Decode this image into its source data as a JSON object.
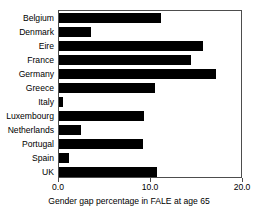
{
  "chart_data": {
    "type": "bar",
    "orientation": "horizontal",
    "title": "",
    "xlabel": "Gender gap percentage in FALE at age 65",
    "ylabel": "",
    "xlim": [
      0.0,
      20.0
    ],
    "xticks": [
      "0.0",
      "10.0",
      "20.0"
    ],
    "xtick_values": [
      0.0,
      10.0,
      20.0
    ],
    "grid": false,
    "legend": false,
    "bar_color": "#000000",
    "frame_color": "#4d4d4d",
    "categories": [
      "Belgium",
      "Denmark",
      "Eire",
      "France",
      "Germany",
      "Greece",
      "Italy",
      "Luxembourg",
      "Netherlands",
      "Portugal",
      "Spain",
      "UK"
    ],
    "values": [
      11.1,
      3.5,
      15.7,
      14.3,
      17.1,
      10.4,
      0.4,
      9.2,
      2.4,
      9.1,
      1.1,
      10.6
    ]
  }
}
